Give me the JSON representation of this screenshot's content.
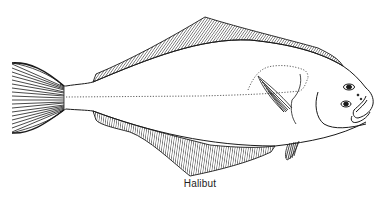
{
  "figure": {
    "caption": "Halibut",
    "ink_color": "#1a1a1a",
    "background": "#ffffff"
  }
}
